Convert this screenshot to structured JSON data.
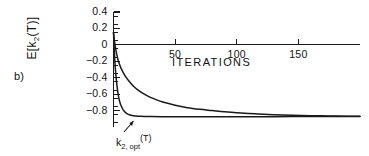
{
  "figure": {
    "panel_label": "b)",
    "axis_color": "#1a1a1a",
    "curve_color": "#1a1a1a",
    "background": "#ffffff"
  },
  "annotations": {
    "optimal_curve": {
      "base": "k",
      "sub": "2, opt",
      "sup": "(T)",
      "full": "k2,opt(T)"
    }
  },
  "chart_data": {
    "type": "line",
    "title": "",
    "xlabel": "ITERATIONS",
    "ylabel": "E[k2(T)]",
    "ylabel_base": "E[k",
    "ylabel_sub": "2",
    "ylabel_tail": "(T)]",
    "xlim": [
      0,
      200
    ],
    "ylim": [
      -1.0,
      0.4
    ],
    "grid": false,
    "legend": false,
    "xticks": [
      50,
      100,
      150
    ],
    "xtick_labels": [
      "50",
      "100",
      "150"
    ],
    "yticks": [
      0.4,
      0.2,
      0,
      -0.2,
      -0.4,
      -0.6,
      -0.8
    ],
    "ytick_labels": [
      "0.4",
      "0.2",
      "0",
      "-0.2",
      "-0.4",
      "-0.6",
      "-0.8"
    ],
    "yminor_step": 0.1,
    "series": [
      {
        "name": "E[k2(T)] adaptive",
        "x": [
          0,
          1,
          2,
          3,
          4,
          6,
          8,
          10,
          13,
          16,
          20,
          25,
          30,
          35,
          40,
          50,
          60,
          70,
          80,
          90,
          100,
          115,
          130,
          145,
          160,
          175,
          190,
          200
        ],
        "values": [
          0.15,
          0.02,
          -0.07,
          -0.14,
          -0.2,
          -0.28,
          -0.34,
          -0.39,
          -0.45,
          -0.5,
          -0.55,
          -0.6,
          -0.64,
          -0.67,
          -0.695,
          -0.735,
          -0.765,
          -0.785,
          -0.8,
          -0.815,
          -0.827,
          -0.84,
          -0.85,
          -0.857,
          -0.862,
          -0.866,
          -0.869,
          -0.87
        ]
      },
      {
        "name": "k2,opt(T) optimal",
        "x": [
          0,
          1,
          2,
          3,
          4,
          5,
          6,
          8,
          10,
          12,
          15,
          18,
          22,
          26,
          30,
          40,
          55,
          75,
          100,
          130,
          160,
          190,
          200
        ],
        "values": [
          0.15,
          -0.18,
          -0.38,
          -0.52,
          -0.62,
          -0.69,
          -0.735,
          -0.795,
          -0.828,
          -0.846,
          -0.86,
          -0.866,
          -0.87,
          -0.872,
          -0.873,
          -0.874,
          -0.875,
          -0.875,
          -0.875,
          -0.874,
          -0.873,
          -0.872,
          -0.872
        ]
      }
    ]
  }
}
